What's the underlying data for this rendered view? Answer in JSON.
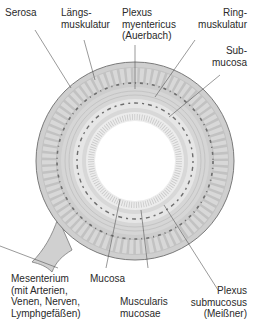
{
  "diagram": {
    "type": "cross-section of intestinal wall",
    "labels": {
      "serosa": "Serosa",
      "laengsmuskulatur": "Längs-\nmuskulatur",
      "plexus_myentericus": "Plexus\nmyentericus\n(Auerbach)",
      "ringmuskulatur": "Ring-\nmuskulatur",
      "submucosa": "Sub-\nmucosa",
      "mesenterium": "Mesenterium\n(mit Arterien,\nVenen, Nerven,\nLymphgefäßen)",
      "mucosa": "Mucosa",
      "muscularis_mucosae": "Muscularis\nmucosae",
      "plexus_submucosus": "Plexus\nsubmucosus\n(Meißner)"
    },
    "colors": {
      "outline": "#7a7a7a",
      "serosa": "#c8c8c8",
      "muscle_longitudinal": "#bdbdbd",
      "muscle_ring": "#d2d2d2",
      "submucosa": "#e4e4e4",
      "mucosa": "#ececec",
      "lumen": "#ffffff",
      "plexus": "#6e6e6e",
      "leader_line": "#555555"
    }
  }
}
